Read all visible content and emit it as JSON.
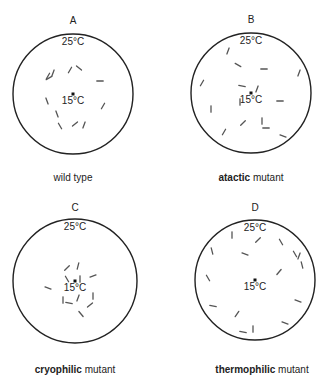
{
  "panels": [
    {
      "letter": "A",
      "outer_temp": "25°C",
      "center_temp": "15°C",
      "caption_bold": "",
      "caption_rest": "wild type",
      "center": [
        73,
        94
      ],
      "radius": 60,
      "worms": [
        [
          49,
          78,
          -30
        ],
        [
          53,
          73,
          -70
        ],
        [
          70,
          70,
          -60
        ],
        [
          79,
          68,
          40
        ],
        [
          100,
          81,
          0
        ],
        [
          47,
          101,
          70
        ],
        [
          103,
          106,
          -60
        ],
        [
          57,
          114,
          70
        ],
        [
          60,
          126,
          60
        ],
        [
          75,
          124,
          -40
        ],
        [
          84,
          125,
          -70
        ],
        [
          48,
          76,
          -60
        ]
      ]
    },
    {
      "letter": "B",
      "outer_temp": "25°C",
      "center_temp": "15°C",
      "caption_bold": "atactic",
      "caption_rest": " mutant",
      "center": [
        251,
        93
      ],
      "radius": 60,
      "worms": [
        [
          228,
          51,
          -70
        ],
        [
          238,
          65,
          30
        ],
        [
          264,
          69,
          0
        ],
        [
          299,
          73,
          -70
        ],
        [
          202,
          83,
          -60
        ],
        [
          242,
          86,
          10
        ],
        [
          257,
          89,
          -70
        ],
        [
          240,
          102,
          90
        ],
        [
          280,
          101,
          0
        ],
        [
          211,
          109,
          90
        ],
        [
          243,
          123,
          -45
        ],
        [
          262,
          121,
          90
        ],
        [
          266,
          128,
          0
        ],
        [
          224,
          132,
          -60
        ],
        [
          283,
          136,
          20
        ]
      ]
    },
    {
      "letter": "C",
      "outer_temp": "25°C",
      "center_temp": "15°C",
      "caption_bold": "cryophilic",
      "caption_rest": " mutant",
      "center": [
        75,
        281
      ],
      "radius": 62,
      "worms": [
        [
          67,
          268,
          -45
        ],
        [
          78,
          266,
          -75
        ],
        [
          93,
          276,
          -20
        ],
        [
          67,
          279,
          60
        ],
        [
          80,
          279,
          90
        ],
        [
          48,
          288,
          20
        ],
        [
          93,
          296,
          90
        ],
        [
          63,
          300,
          90
        ],
        [
          69,
          303,
          10
        ],
        [
          78,
          298,
          -70
        ],
        [
          90,
          305,
          -40
        ],
        [
          81,
          314,
          50
        ]
      ]
    },
    {
      "letter": "D",
      "outer_temp": "25°C",
      "center_temp": "15°C",
      "caption_bold": "thermophilic",
      "caption_rest": " mutant",
      "center": [
        255,
        280
      ],
      "radius": 60,
      "worms": [
        [
          232,
          235,
          90
        ],
        [
          258,
          240,
          -45
        ],
        [
          281,
          242,
          60
        ],
        [
          212,
          251,
          75
        ],
        [
          245,
          254,
          20
        ],
        [
          295,
          254,
          60
        ],
        [
          299,
          256,
          -70
        ],
        [
          302,
          265,
          75
        ],
        [
          279,
          272,
          -50
        ],
        [
          208,
          278,
          60
        ],
        [
          298,
          301,
          20
        ],
        [
          213,
          306,
          10
        ],
        [
          237,
          314,
          -55
        ],
        [
          285,
          323,
          20
        ],
        [
          253,
          329,
          90
        ],
        [
          243,
          332,
          10
        ]
      ]
    }
  ]
}
